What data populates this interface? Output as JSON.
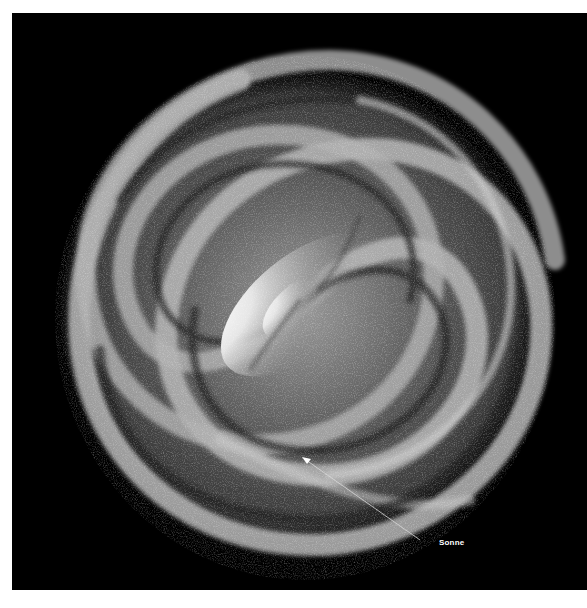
{
  "image": {
    "subject": "spiral-galaxy",
    "background_color": "#000000",
    "border_color": "#ffffff"
  },
  "annotation": {
    "label": "Sonne",
    "arrow": {
      "from": [
        420,
        540
      ],
      "to": [
        303,
        458
      ],
      "color": "#d0d0d0"
    }
  }
}
